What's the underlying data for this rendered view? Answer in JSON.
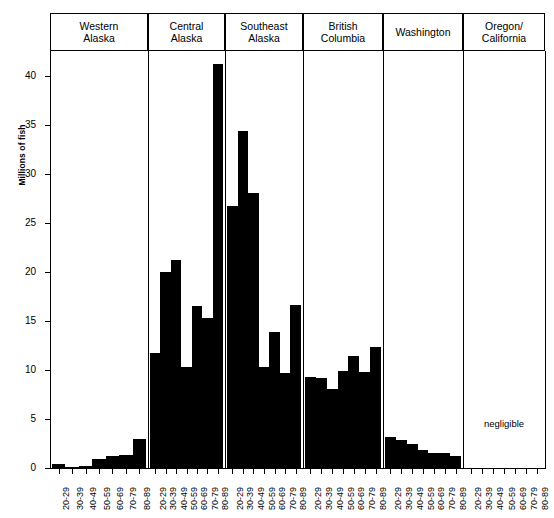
{
  "chart_data": {
    "type": "bar",
    "title": "",
    "subtitle": "",
    "xlabel": "",
    "ylabel": "Millions of fish",
    "ylim": [
      0,
      42.5
    ],
    "yticks": [
      0,
      5,
      10,
      15,
      20,
      25,
      30,
      35,
      40
    ],
    "ytick_labels": [
      "0",
      "5",
      "10",
      "15",
      "20",
      "25",
      "30",
      "35",
      "40"
    ],
    "grid": false,
    "legend": "none",
    "categories": [
      "20-29",
      "30-39",
      "40-49",
      "50-59",
      "60-69",
      "70-79",
      "80-89"
    ],
    "panel_layout": "horizontal-facets",
    "panels": [
      {
        "label_line1": "Western",
        "label_line2": "Alaska",
        "values": [
          0.4,
          0.15,
          0.2,
          0.9,
          1.2,
          1.3,
          3.0
        ],
        "note": ""
      },
      {
        "label_line1": "Central",
        "label_line2": "Alaska",
        "values": [
          11.7,
          20.0,
          21.2,
          10.3,
          16.5,
          15.3,
          41.2
        ],
        "note": ""
      },
      {
        "label_line1": "Southeast",
        "label_line2": "Alaska",
        "values": [
          26.7,
          34.3,
          28.0,
          10.3,
          13.9,
          9.7,
          16.6
        ],
        "note": ""
      },
      {
        "label_line1": "British",
        "label_line2": "Columbia",
        "values": [
          9.3,
          9.2,
          8.1,
          9.9,
          11.4,
          9.8,
          12.3
        ],
        "note": ""
      },
      {
        "label_line1": "Washington",
        "label_line2": "",
        "values": [
          3.2,
          2.9,
          2.4,
          1.8,
          1.5,
          1.5,
          1.2
        ],
        "note": ""
      },
      {
        "label_line1": "Oregon/",
        "label_line2": "California",
        "values": [
          0,
          0,
          0,
          0,
          0,
          0,
          0
        ],
        "note": "negligible"
      }
    ],
    "colors": {
      "bar": "#000000",
      "axis": "#000000",
      "background": "#ffffff",
      "text": "#000000"
    }
  }
}
